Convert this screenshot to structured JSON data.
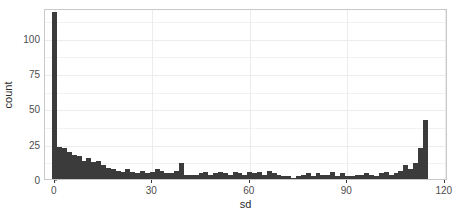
{
  "chart_data": {
    "type": "bar",
    "subtype": "histogram",
    "title": "",
    "xlabel": "sd",
    "ylabel": "count",
    "xlim": [
      -3,
      121
    ],
    "ylim": [
      0,
      121
    ],
    "xticks": [
      0,
      30,
      60,
      90,
      120
    ],
    "yticks": [
      0,
      25,
      50,
      75,
      100
    ],
    "xtick_labels": [
      "0",
      "30",
      "60",
      "90",
      "120"
    ],
    "ytick_labels": [
      "0",
      "25",
      "50",
      "75",
      "100"
    ],
    "grid": "light-horizontal-and-vertical",
    "legend": "none",
    "bar_color": "#3b3b3b",
    "panel_background": "#ffffff",
    "panel_border": "#c8c8c8",
    "grid_color": "#ececec",
    "bin_width": 1.5,
    "bin_starts": [
      -0.75,
      0.75,
      2.25,
      3.75,
      5.25,
      6.75,
      8.25,
      9.75,
      11.25,
      12.75,
      14.25,
      15.75,
      17.25,
      18.75,
      20.25,
      21.75,
      23.25,
      24.75,
      26.25,
      27.75,
      29.25,
      30.75,
      32.25,
      33.75,
      35.25,
      36.75,
      38.25,
      39.75,
      41.25,
      42.75,
      44.25,
      45.75,
      47.25,
      48.75,
      50.25,
      51.75,
      53.25,
      54.75,
      56.25,
      57.75,
      59.25,
      60.75,
      62.25,
      63.75,
      65.25,
      66.75,
      68.25,
      69.75,
      71.25,
      72.75,
      74.25,
      75.75,
      77.25,
      78.75,
      80.25,
      81.75,
      83.25,
      84.75,
      86.25,
      87.75,
      89.25,
      90.75,
      92.25,
      93.75,
      95.25,
      96.75,
      98.25,
      99.75,
      101.25,
      102.75,
      104.25,
      105.75,
      107.25,
      108.75,
      110.25,
      111.75,
      113.25
    ],
    "counts": [
      118,
      23,
      22,
      19,
      17,
      16,
      13,
      15,
      12,
      13,
      10,
      8,
      7,
      6,
      5,
      7,
      5,
      4,
      6,
      4,
      5,
      7,
      6,
      4,
      4,
      6,
      11,
      3,
      3,
      3,
      4,
      5,
      3,
      4,
      5,
      4,
      3,
      5,
      4,
      3,
      5,
      4,
      5,
      3,
      6,
      4,
      3,
      2,
      2,
      1,
      2,
      3,
      4,
      2,
      4,
      3,
      3,
      5,
      2,
      4,
      2,
      2,
      3,
      3,
      4,
      3,
      2,
      4,
      5,
      3,
      4,
      6,
      10,
      7,
      11,
      22,
      42
    ],
    "max_count": 118
  },
  "axis": {
    "y_title": "count",
    "x_title": "sd"
  }
}
